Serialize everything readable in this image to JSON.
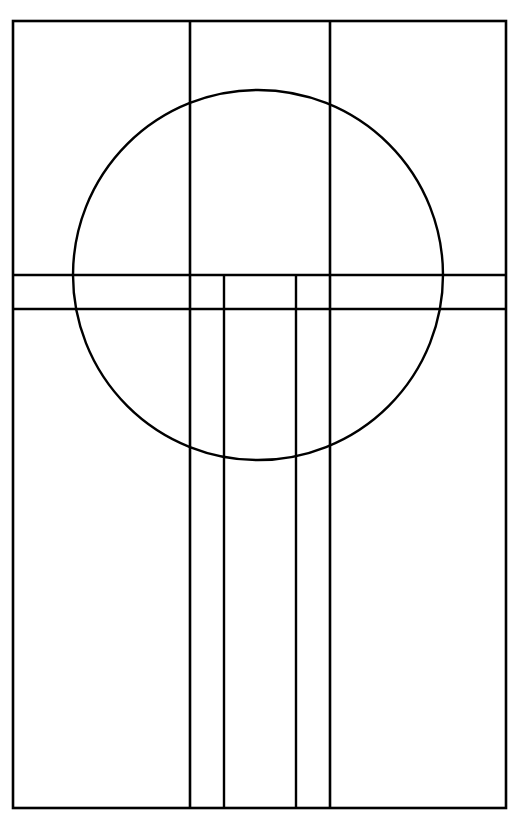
{
  "document": {
    "title": "Geometric Line Drawing",
    "kind": "line-diagram",
    "canvas_width": 518,
    "canvas_height": 817,
    "background_color": "#ffffff",
    "stroke_color": "#000000"
  },
  "figure": {
    "name": "circle-and-grid-composition",
    "frame": {
      "name": "outer-frame",
      "x": 13,
      "y": 21,
      "width": 493,
      "height": 787,
      "stroke_width": 2.6
    },
    "circle": {
      "name": "large-circle",
      "cx": 258,
      "cy": 275,
      "r": 185,
      "stroke_width": 2.4
    },
    "vertical_lines": [
      {
        "name": "vertical-line-outer-left",
        "x": 190,
        "y1": 21,
        "y2": 808,
        "stroke_width": 2.6,
        "span": "full-height"
      },
      {
        "name": "vertical-line-inner-left",
        "x": 224,
        "y1": 275,
        "y2": 808,
        "stroke_width": 2.4,
        "span": "below-band"
      },
      {
        "name": "vertical-line-inner-right",
        "x": 296,
        "y1": 275,
        "y2": 808,
        "stroke_width": 2.4,
        "span": "below-band"
      },
      {
        "name": "vertical-line-outer-right",
        "x": 330,
        "y1": 21,
        "y2": 808,
        "stroke_width": 2.6,
        "span": "full-height"
      }
    ],
    "horizontal_lines": [
      {
        "name": "band-line-top",
        "y": 275,
        "x1": 13,
        "x2": 506,
        "stroke_width": 2.4,
        "span": "full-width"
      },
      {
        "name": "band-line-bottom",
        "y": 309,
        "x1": 13,
        "x2": 506,
        "stroke_width": 2.4,
        "span": "full-width"
      }
    ],
    "regions": [
      {
        "name": "region-upper-left",
        "label": ""
      },
      {
        "name": "region-upper-center",
        "label": ""
      },
      {
        "name": "region-upper-right",
        "label": ""
      },
      {
        "name": "region-band",
        "label": ""
      },
      {
        "name": "region-lower-left",
        "label": ""
      },
      {
        "name": "region-lower-center",
        "label": ""
      },
      {
        "name": "region-lower-right",
        "label": ""
      }
    ]
  }
}
